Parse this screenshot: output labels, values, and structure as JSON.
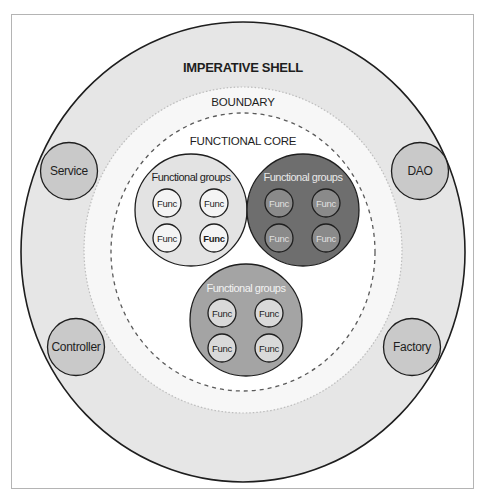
{
  "diagram": {
    "shell": {
      "label": "IMPERATIVE SHELL",
      "fill": "#e6e6e6",
      "stroke": "#1e1e1e"
    },
    "boundary": {
      "label": "BOUNDARY",
      "fill": "#f7f7f7",
      "stroke": "#bdbdbd"
    },
    "core": {
      "label": "FUNCTIONAL CORE",
      "fill": "#ffffff",
      "stroke": "#5a5a5a"
    },
    "satellites": [
      {
        "label": "Service",
        "cx": 69,
        "cy": 171
      },
      {
        "label": "DAO",
        "cx": 420,
        "cy": 171
      },
      {
        "label": "Controller",
        "cx": 76,
        "cy": 347
      },
      {
        "label": "Factory",
        "cx": 412,
        "cy": 347
      }
    ],
    "satellite_fill": "#c9c9c9",
    "groups": [
      {
        "label": "Functional groups",
        "cx": 191,
        "cy": 210,
        "fill": "#e3e3e3",
        "label_color": "#1e1e1e",
        "func_fill": "#f4f4f4",
        "func_text": "#1e1e1e",
        "funcs": [
          "Func",
          "Func",
          "Func",
          "Func"
        ]
      },
      {
        "label": "Functional groups",
        "cx": 303,
        "cy": 210,
        "fill": "#6e6e6e",
        "label_color": "#e8e8e8",
        "func_fill": "#8a8a8a",
        "func_text": "#e0e0e0",
        "funcs": [
          "Func",
          "Func",
          "Func",
          "Func"
        ]
      },
      {
        "label": "Functional groups",
        "cx": 246,
        "cy": 320,
        "fill": "#a4a4a4",
        "label_color": "#f2f2f2",
        "func_fill": "#d9d9d9",
        "func_text": "#1e1e1e",
        "funcs": [
          "Func",
          "Func",
          "Func",
          "Func"
        ]
      }
    ]
  }
}
